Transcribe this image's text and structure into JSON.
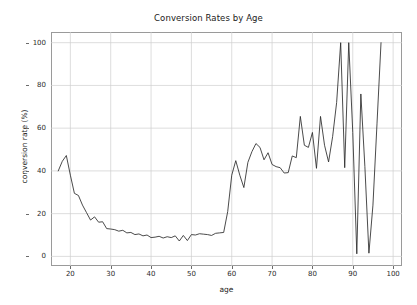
{
  "figure": {
    "background_color": "#ffffff",
    "line_color": "#2b2b2b",
    "grid_color": "#cfcfcf",
    "frame_color": "#9a9a9a"
  },
  "chart_data": {
    "type": "line",
    "title": "Conversion Rates by Age",
    "xlabel": "age",
    "ylabel": "conversion rate (%)",
    "xlim": [
      15.2,
      102.2
    ],
    "ylim": [
      -4.5,
      105.0
    ],
    "xticks": [
      20,
      30,
      40,
      50,
      60,
      70,
      80,
      90,
      100
    ],
    "yticks": [
      0,
      20,
      40,
      60,
      80,
      100
    ],
    "xtick_labels": [
      "20",
      "30",
      "40",
      "50",
      "60",
      "70",
      "80",
      "90",
      "100"
    ],
    "ytick_labels": [
      "0",
      "20",
      "40",
      "60",
      "80",
      "100"
    ],
    "grid": true,
    "legend": false,
    "legend_position": "none",
    "series": [
      {
        "name": "conversion rate",
        "x": [
          17,
          18,
          19,
          20,
          21,
          22,
          23,
          24,
          25,
          26,
          27,
          28,
          29,
          30,
          31,
          32,
          33,
          34,
          35,
          36,
          37,
          38,
          39,
          40,
          41,
          42,
          43,
          44,
          45,
          46,
          47,
          48,
          49,
          50,
          51,
          52,
          53,
          54,
          55,
          56,
          57,
          58,
          59,
          60,
          61,
          62,
          63,
          64,
          65,
          66,
          67,
          68,
          69,
          70,
          71,
          72,
          73,
          74,
          75,
          76,
          77,
          78,
          79,
          80,
          81,
          82,
          83,
          84,
          85,
          86,
          87,
          88,
          89,
          90,
          91,
          92,
          93,
          94,
          95,
          96,
          97
        ],
        "values": [
          40.0,
          44.5,
          47.2,
          38.0,
          29.5,
          28.5,
          24.0,
          20.5,
          17.0,
          18.5,
          16.0,
          16.2,
          13.0,
          12.8,
          12.5,
          11.8,
          12.2,
          11.0,
          11.2,
          10.2,
          10.5,
          9.6,
          10.0,
          8.8,
          9.0,
          9.4,
          8.6,
          9.2,
          8.8,
          9.6,
          7.2,
          9.8,
          7.4,
          10.2,
          10.0,
          10.6,
          10.4,
          10.2,
          9.8,
          10.8,
          11.0,
          11.2,
          21.0,
          38.0,
          44.8,
          38.0,
          32.2,
          44.0,
          49.0,
          52.8,
          51.0,
          45.2,
          48.5,
          43.0,
          42.0,
          41.5,
          39.0,
          39.2,
          47.0,
          46.2,
          65.5,
          52.0,
          51.0,
          58.0,
          41.2,
          65.5,
          52.0,
          44.2,
          56.0,
          72.0,
          100.0,
          41.5,
          100.0,
          58.0,
          1.2,
          76.0,
          42.0,
          1.5,
          24.0,
          62.0,
          100.0
        ]
      }
    ]
  }
}
